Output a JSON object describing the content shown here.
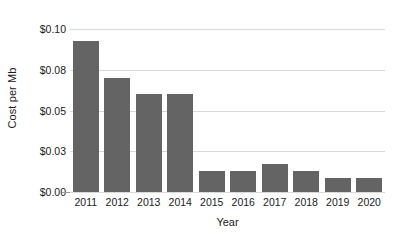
{
  "chart_data": {
    "type": "bar",
    "title": "",
    "xlabel": "Year",
    "ylabel": "Cost per Mb",
    "categories": [
      "2011",
      "2012",
      "2013",
      "2014",
      "2015",
      "2016",
      "2017",
      "2018",
      "2019",
      "2020"
    ],
    "values": [
      0.093,
      0.07,
      0.06,
      0.06,
      0.0128,
      0.0128,
      0.017,
      0.0128,
      0.0088,
      0.0088
    ],
    "ylim": [
      0.0,
      0.105
    ],
    "ytick_values": [
      0.0,
      0.025,
      0.05,
      0.075,
      0.1
    ],
    "ytick_labels": [
      "$0.00",
      "$0.03",
      "$0.05",
      "$0.08",
      "$0.10"
    ],
    "grid": true,
    "legend": null,
    "series_name": "Cost per Mb",
    "bar_color": "#646464",
    "gridline_color": "#d9d9d9",
    "axis_color": "#9a9a9a",
    "background_color": "#ffffff"
  }
}
